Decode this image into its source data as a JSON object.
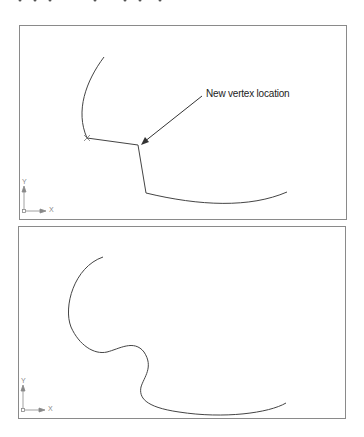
{
  "figure": {
    "panels": [
      {
        "id": "before",
        "annotation": "New vertex location",
        "ucs": {
          "x_label": "X",
          "y_label": "Y"
        }
      },
      {
        "id": "after",
        "ucs": {
          "x_label": "X",
          "y_label": "Y"
        }
      }
    ],
    "colors": {
      "line": "#444444",
      "frame": "#8a8a8a",
      "ucs": "#888888"
    }
  }
}
